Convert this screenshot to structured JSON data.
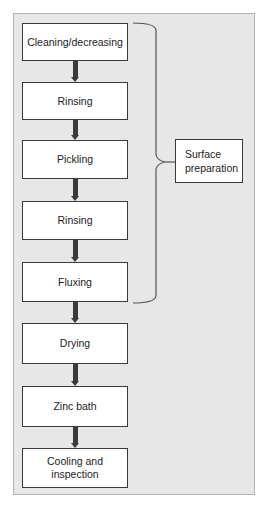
{
  "diagram": {
    "type": "process-flowchart",
    "steps": [
      {
        "label": "Cleaning/decreasing"
      },
      {
        "label": "Rinsing"
      },
      {
        "label": "Pickling"
      },
      {
        "label": "Rinsing"
      },
      {
        "label": "Fluxing"
      },
      {
        "label": "Drying"
      },
      {
        "label": "Zinc bath"
      },
      {
        "label": "Cooling and inspection"
      }
    ],
    "group": {
      "label": "Surface preparation",
      "spans_steps": [
        0,
        4
      ]
    },
    "colors": {
      "background": "#e7e7e7",
      "box_fill": "#ffffff",
      "stroke": "#3a3a3a"
    }
  }
}
